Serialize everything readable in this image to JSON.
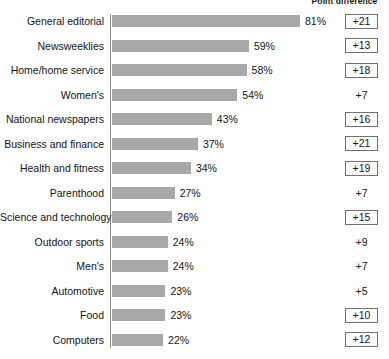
{
  "header": {
    "delta_column_title": "Point difference"
  },
  "chart_data": {
    "type": "bar",
    "title": "",
    "subtitle": "",
    "xlabel": "",
    "ylabel": "",
    "orientation": "horizontal",
    "grid": false,
    "legend": false,
    "xlim": [
      0,
      81
    ],
    "value_suffix": "%",
    "categories": [
      "General editorial",
      "Newsweeklies",
      "Home/home service",
      "Women's",
      "National newspapers",
      "Business and finance",
      "Health and fitness",
      "Parenthood",
      "Science and technology",
      "Outdoor sports",
      "Men's",
      "Automotive",
      "Food",
      "Computers"
    ],
    "values": [
      81,
      59,
      58,
      54,
      43,
      37,
      34,
      27,
      26,
      24,
      24,
      23,
      23,
      22
    ],
    "value_labels": [
      "81%",
      "59%",
      "58%",
      "54%",
      "43%",
      "37%",
      "34%",
      "27%",
      "26%",
      "24%",
      "24%",
      "23%",
      "23%",
      "22%"
    ],
    "annotations": {
      "column_title": "Point difference",
      "values": [
        "+21",
        "+13",
        "+18",
        "+7",
        "+16",
        "+21",
        "+19",
        "+7",
        "+15",
        "+9",
        "+7",
        "+5",
        "+10",
        "+12"
      ],
      "boxed": [
        true,
        true,
        true,
        false,
        true,
        true,
        true,
        false,
        true,
        false,
        false,
        false,
        true,
        true
      ]
    },
    "colors": {
      "bar": "#a8a8a8",
      "axis": "#8e8e8e",
      "text": "#141414",
      "box_border": "#6f6f6f",
      "background": "#ffffff"
    }
  }
}
